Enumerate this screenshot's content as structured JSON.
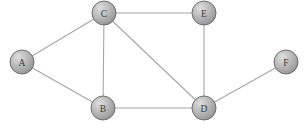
{
  "figure": {
    "type": "undirected-graph-diagram",
    "background_color": "#ffffff",
    "width": 304,
    "height": 129
  },
  "style": {
    "node_radius": 12,
    "node_fill_light": "#d8d8d8",
    "node_fill_mid": "#b4b4b4",
    "node_fill_dark": "#8f8f8f",
    "node_stroke": "#6e6e6e",
    "edge_color": "#a6a6a6",
    "edge_width": 1.1,
    "label_color": "#3a3a3a"
  },
  "nodes": [
    {
      "id": "A",
      "label": "A",
      "x": 22,
      "y": 62
    },
    {
      "id": "B",
      "label": "B",
      "x": 103,
      "y": 108
    },
    {
      "id": "C",
      "label": "C",
      "x": 104,
      "y": 13
    },
    {
      "id": "D",
      "label": "D",
      "x": 204,
      "y": 108
    },
    {
      "id": "E",
      "label": "E",
      "x": 204,
      "y": 13
    },
    {
      "id": "F",
      "label": "F",
      "x": 286,
      "y": 62
    }
  ],
  "edges": [
    {
      "from": "A",
      "to": "C"
    },
    {
      "from": "A",
      "to": "B"
    },
    {
      "from": "C",
      "to": "B"
    },
    {
      "from": "C",
      "to": "E"
    },
    {
      "from": "C",
      "to": "D"
    },
    {
      "from": "B",
      "to": "D"
    },
    {
      "from": "E",
      "to": "D"
    },
    {
      "from": "D",
      "to": "F"
    }
  ]
}
